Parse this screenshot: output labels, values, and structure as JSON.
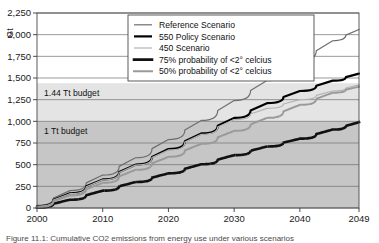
{
  "figure": {
    "caption": "Figure 11.1: Cumulative CO2 emissions from energy use under various scenarios",
    "y_axis_unit": "Gt"
  },
  "chart_data": {
    "type": "line",
    "title": "",
    "xlabel": "",
    "ylabel": "Gt",
    "xlim": [
      2000,
      2049
    ],
    "ylim": [
      0,
      2250
    ],
    "ytick_step": 250,
    "grid": true,
    "legend_position": "top-center",
    "xticks": [
      "2000",
      "2010",
      "2020",
      "2030",
      "2040",
      "2049"
    ],
    "yticks": [
      "0",
      "250",
      "500",
      "750",
      "1,000",
      "1,250",
      "1,500",
      "1,750",
      "2,000",
      "2,250"
    ],
    "x": [
      2000,
      2005,
      2010,
      2015,
      2020,
      2025,
      2030,
      2035,
      2040,
      2045,
      2049
    ],
    "series": [
      {
        "name": "Reference Scenario",
        "color": "#6e6e6e",
        "style": "solid",
        "width": 1.2,
        "values": [
          30,
          200,
          380,
          580,
          790,
          1010,
          1240,
          1470,
          1700,
          1930,
          2060
        ]
      },
      {
        "name": "550 Policy Scenario",
        "color": "#000000",
        "style": "solid",
        "width": 2.2,
        "values": [
          20,
          170,
          330,
          500,
          680,
          860,
          1040,
          1210,
          1350,
          1470,
          1550
        ]
      },
      {
        "name": "450 Scenario",
        "color": "#b4b4b4",
        "style": "solid",
        "width": 1.2,
        "values": [
          20,
          165,
          325,
          495,
          670,
          850,
          1020,
          1150,
          1250,
          1350,
          1420
        ]
      },
      {
        "name": "75% probability of <2° celcius",
        "color": "#111111",
        "style": "dotted",
        "width": 2.6,
        "values": [
          5,
          95,
          200,
          300,
          400,
          505,
          610,
          710,
          800,
          905,
          990
        ]
      },
      {
        "name": "50% probability of <2° celcius",
        "color": "#9a9a9a",
        "style": "dotted",
        "width": 2.0,
        "values": [
          10,
          145,
          290,
          440,
          590,
          740,
          890,
          1040,
          1190,
          1330,
          1400
        ]
      }
    ],
    "bands": [
      {
        "name": "1.44 Tt budget",
        "from": 1000,
        "to": 1440,
        "color": "#e4e4e4"
      },
      {
        "name": "1 Tt budget",
        "from": 0,
        "to": 1000,
        "color": "#c6c6c6"
      }
    ],
    "annotations": [
      {
        "name": "1.44 Tt budget",
        "label": "1.44 Tt budget",
        "value": 1440
      },
      {
        "name": "1 Tt budget",
        "label": "1 Tt budget",
        "value": 1000
      }
    ]
  },
  "legend": {
    "items": [
      {
        "label": "Reference Scenario"
      },
      {
        "label": "550 Policy Scenario"
      },
      {
        "label": "450 Scenario"
      },
      {
        "label": "75% probability of <2° celcius"
      },
      {
        "label": "50% probability of <2° celcius"
      }
    ]
  }
}
